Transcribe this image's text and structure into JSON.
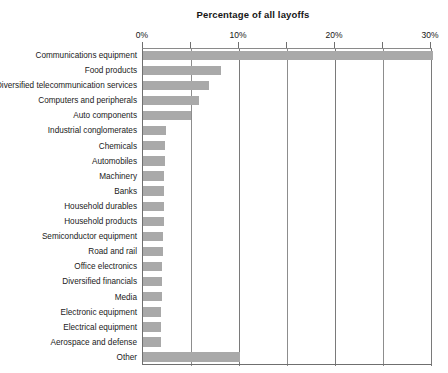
{
  "chart": {
    "title": "Percentage of all layoffs",
    "axis": {
      "labels": [
        "0%",
        "10%",
        "20%",
        "30%"
      ],
      "label_values": [
        0,
        10,
        20,
        30
      ],
      "minor_values": [
        5,
        15,
        25
      ],
      "position": "top"
    }
  },
  "chart_data": {
    "type": "bar",
    "orientation": "horizontal",
    "title": "Percentage of all layoffs",
    "xlabel": "Percentage of all layoffs",
    "ylabel": "",
    "xlim": [
      0,
      30.5
    ],
    "xticks": [
      0,
      10,
      20,
      30
    ],
    "xticklabels": [
      "0%",
      "10%",
      "20%",
      "30%"
    ],
    "minor_xticks": [
      5,
      15,
      25
    ],
    "grid": true,
    "legend": null,
    "bar_color": "#a9a9a9",
    "categories": [
      "Communications equipment",
      "Food products",
      "Diversified telecommunication services",
      "Computers and peripherals",
      "Auto components",
      "Industrial conglomerates",
      "Chemicals",
      "Automobiles",
      "Machinery",
      "Banks",
      "Household durables",
      "Household products",
      "Semiconductor equipment",
      "Road and rail",
      "Office electronics",
      "Diversified financials",
      "Media",
      "Electronic equipment",
      "Electrical equipment",
      "Aerospace and defense",
      "Other"
    ],
    "values": [
      30.2,
      8.1,
      6.9,
      5.8,
      5.0,
      2.4,
      2.3,
      2.3,
      2.2,
      2.2,
      2.2,
      2.2,
      2.1,
      2.1,
      2.0,
      2.0,
      2.0,
      1.9,
      1.9,
      1.9,
      10.1
    ]
  }
}
